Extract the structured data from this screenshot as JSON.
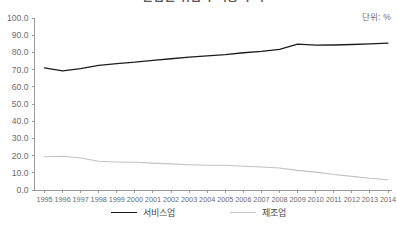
{
  "header": {
    "title": "산업별 취업자 비중 추이",
    "unit_note": "단위: %"
  },
  "legend": {
    "position": "bottom",
    "items": [
      {
        "label": "서비스업",
        "color": "#1d1d1d",
        "name": "legend-item-services"
      },
      {
        "label": "제조업",
        "color": "#c2c2c6",
        "name": "legend-item-manufacturing"
      }
    ]
  },
  "chart_data": {
    "type": "line",
    "title": "산업별 취업자 비중 추이",
    "xlabel": "",
    "ylabel": "",
    "unit": "단위: %",
    "grid": false,
    "legend_position": "bottom",
    "ylim": [
      0.0,
      100.0
    ],
    "yticks": [
      "0.0",
      "10.0",
      "20.0",
      "30.0",
      "40.0",
      "50.0",
      "60.0",
      "70.0",
      "80.0",
      "90.0",
      "100.0"
    ],
    "categories": [
      "1995",
      "1996",
      "1997",
      "1998",
      "1999",
      "2000",
      "2001",
      "2002",
      "2003",
      "2004",
      "2005",
      "2006",
      "2007",
      "2008",
      "2009",
      "2010",
      "2011",
      "2012",
      "2013",
      "2014"
    ],
    "series": [
      {
        "name": "서비스업",
        "color": "#1d1d1d",
        "values": [
          71.0,
          69.2,
          70.6,
          72.5,
          73.5,
          74.3,
          75.4,
          76.3,
          77.3,
          78.0,
          78.7,
          79.8,
          80.6,
          81.8,
          84.8,
          84.2,
          84.3,
          84.6,
          85.0,
          85.4
        ]
      },
      {
        "name": "제조업",
        "color": "#c2c2c6",
        "values": [
          19.3,
          19.6,
          18.6,
          16.7,
          16.3,
          16.1,
          15.6,
          15.2,
          14.7,
          14.4,
          14.4,
          13.8,
          13.4,
          12.8,
          11.4,
          10.4,
          9.0,
          7.9,
          6.8,
          6.0
        ]
      }
    ]
  }
}
